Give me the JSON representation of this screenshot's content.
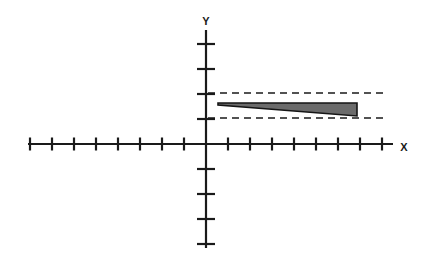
{
  "figure": {
    "title": "",
    "background_color": "#ffffff",
    "width": 424,
    "height": 261
  },
  "axes": {
    "x_axis": {
      "label": "X",
      "label_x": 404,
      "label_y": 148,
      "line_color": "#1a1a1a",
      "line_width": 2.2,
      "start_x": 28,
      "end_x": 393,
      "y": 144,
      "tick_half_length": 6.5,
      "tick_spacing": 22,
      "ticks_negative": 8,
      "ticks_positive": 8
    },
    "y_axis": {
      "label": "Y",
      "label_x": 206,
      "label_y": 22,
      "line_color": "#1a1a1a",
      "line_width": 2.2,
      "start_y": 30,
      "end_y": 248,
      "x": 206,
      "tick_half_length": 9,
      "tick_spacing": 25,
      "ticks_positive": 4,
      "ticks_negative": 4
    },
    "origin": {
      "x": 206,
      "y": 144
    }
  },
  "guides": {
    "color": "#1a1a1a",
    "line_width": 1.4,
    "dash_pattern": "7,5",
    "start_x": 208,
    "end_x": 388,
    "upper_line_y": 93,
    "lower_line_y": 118,
    "upper_line_value": 2,
    "lower_line_value": 1
  },
  "chart_data": {
    "type": "scatter",
    "title": "",
    "xlabel": "X",
    "ylabel": "Y",
    "grid": false,
    "legend": "none",
    "xlim": [
      -8,
      8
    ],
    "ylim": [
      -4,
      4
    ],
    "xticks": [
      -8,
      -7,
      -6,
      -5,
      -4,
      -3,
      -2,
      -1,
      0,
      1,
      2,
      3,
      4,
      5,
      6,
      7,
      8
    ],
    "yticks": [
      -4,
      -3,
      -2,
      -1,
      0,
      1,
      2,
      3,
      4
    ],
    "xticklabels": [],
    "yticklabels": [],
    "annotations": [
      {
        "name": "upper-asymptote",
        "type": "horizontal-dashed-line",
        "y_value": 2,
        "x_from": 0,
        "x_to": 8.2
      },
      {
        "name": "lower-asymptote",
        "type": "horizontal-dashed-line",
        "y_value": 1,
        "x_from": 0,
        "x_to": 8.2
      }
    ],
    "shapes": [
      {
        "name": "shaded-wedge",
        "type": "polygon",
        "fill": "#6b6b6b",
        "stroke": "#151515",
        "stroke_width": 1.6,
        "description": "thin wedge narrowing to a point at the left, widening to the right and terminating in a vertical edge between the two dashed lines",
        "points_data": [
          [
            0.55,
            1.65
          ],
          [
            6.85,
            1.63
          ],
          [
            6.85,
            1.12
          ]
        ],
        "points_pixels": [
          [
            218,
            103
          ],
          [
            357,
            103
          ],
          [
            357,
            116
          ]
        ]
      }
    ]
  },
  "wedge": {
    "fill_color": "#6b6b6b",
    "stroke_color": "#151515",
    "stroke_width": 1.6,
    "tip_x": 218,
    "tip_y": 103,
    "top_right_x": 357,
    "top_right_y": 103,
    "bottom_right_x": 357,
    "bottom_right_y": 116,
    "taper_bottom_x": 218,
    "taper_bottom_y": 105
  }
}
